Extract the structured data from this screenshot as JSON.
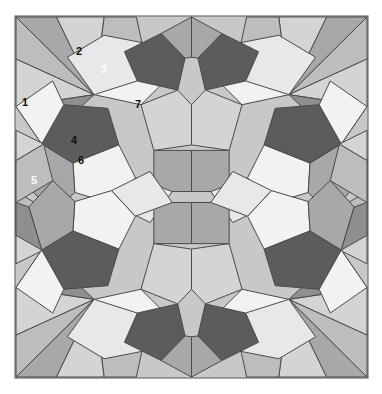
{
  "figure": {
    "type": "geometric-tiling",
    "canvas": {
      "width": 382,
      "height": 394
    },
    "background_color": "#ffffff",
    "frame": {
      "fill": "#c8c8c8",
      "stroke": "#6e6e6e",
      "x": 15,
      "y": 16,
      "width": 353,
      "height": 362
    },
    "stroke_color": "#4a4a4a",
    "stroke_width": 1,
    "symmetry": "4-fold mirror (2x2 quadrants, reflected horizontally and vertically)",
    "quadrants": 4
  },
  "palette": {
    "very_dark": "#4d4d4d",
    "dark": "#5c5c5c",
    "mid_dark": "#8f8f8f",
    "mid": "#a8a8a8",
    "mid_light": "#bdbdbd",
    "light": "#d4d4d4",
    "very_light": "#e8e8e8",
    "white": "#f2f2f2",
    "frame": "#c8c8c8",
    "outline": "#4a4a4a"
  },
  "labels": [
    {
      "id": "1",
      "text": "1",
      "x": 25,
      "y": 106,
      "color_class": "lbl-dark"
    },
    {
      "id": "2",
      "text": "2",
      "x": 79,
      "y": 55,
      "color_class": "lbl-dark"
    },
    {
      "id": "3",
      "text": "3",
      "x": 104,
      "y": 73,
      "color_class": "lbl-light"
    },
    {
      "id": "4",
      "text": "4",
      "x": 74,
      "y": 144,
      "color_class": "lbl-dark"
    },
    {
      "id": "5",
      "text": "5",
      "x": 34,
      "y": 184,
      "color_class": "lbl-light"
    },
    {
      "id": "6",
      "text": "6",
      "x": 81,
      "y": 164,
      "color_class": "lbl-dark"
    },
    {
      "id": "7",
      "text": "7",
      "x": 138,
      "y": 108,
      "color_class": "lbl-dark"
    }
  ],
  "quadrant_tiles": [
    {
      "name": "corner-wedge-upper-left",
      "points": "0,0 85,85 44,0",
      "fill": "#a8a8a8"
    },
    {
      "name": "corner-wedge-left-upper",
      "points": "0,0 0,46 85,85",
      "fill": "#bdbdbd"
    },
    {
      "name": "corner-rhomb-top-a",
      "points": "44,0 85,85 96,0",
      "fill": "#d4d4d4"
    },
    {
      "name": "corner-rhomb-left-a",
      "points": "0,46 0,98 85,85",
      "fill": "#d4d4d4"
    },
    {
      "name": "kite-top-outer",
      "points": "96,0 85,85 137,28 131,0",
      "fill": "#bdbdbd"
    },
    {
      "name": "kite-left-outer",
      "points": "0,98 28,139 85,85",
      "fill": "#8f8f8f"
    },
    {
      "name": "rhomb-top-white-a",
      "points": "85,85 137,28 176,56 136,96",
      "fill": "#f2f2f2"
    },
    {
      "name": "pentagon-2",
      "points": "56,44 96,20 137,28 132,70 85,85",
      "fill": "#e8e8e8"
    },
    {
      "name": "pentagon-3",
      "points": "132,70 118,38 158,18 184,45 176,80",
      "fill": "#5c5c5c"
    },
    {
      "name": "rhomb-upper-right",
      "points": "158,18 191,0 191,44 184,45",
      "fill": "#a8a8a8"
    },
    {
      "name": "pentagon-1-dark",
      "points": "28,139 52,96 100,100 112,140 62,160",
      "fill": "#5c5c5c"
    },
    {
      "name": "rhomb-left-white-b",
      "points": "0,98 28,139 52,96 40,70",
      "fill": "#f2f2f2"
    },
    {
      "name": "pentagon-4",
      "points": "62,160 112,140 130,176 104,204 64,192",
      "fill": "#f2f2f2"
    },
    {
      "name": "pentagon-6",
      "points": "28,139 62,160 64,192 40,215 14,186",
      "fill": "#a8a8a8"
    },
    {
      "name": "tile-5-wedge",
      "points": "0,155 28,139 14,186 0,191",
      "fill": "#8f8f8f"
    },
    {
      "name": "pentagon-7",
      "points": "136,96 176,80 191,96 191,140 150,146",
      "fill": "#d4d4d4"
    },
    {
      "name": "center-square",
      "points": "150,146 191,146 191,191 150,191",
      "fill": "#a8a8a8"
    },
    {
      "name": "rhomb-lower-mid",
      "points": "104,204 130,176 170,191 146,225",
      "fill": "#e8e8e8"
    },
    {
      "name": "rhomb-bottom-left",
      "points": "0,191 40,215 30,255 0,237",
      "fill": "#bdbdbd"
    },
    {
      "name": "corner-bottom-wedge",
      "points": "0,237 30,255 0,270",
      "fill": "#d4d4d4"
    }
  ]
}
